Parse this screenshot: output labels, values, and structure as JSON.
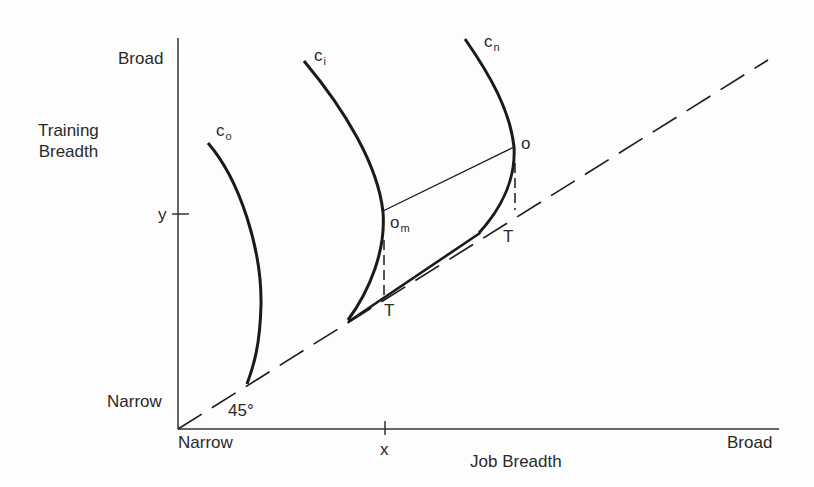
{
  "figure": {
    "y_axis": {
      "title_line1": "Training",
      "title_line2": "Breadth",
      "top_label": "Broad",
      "bottom_label": "Narrow",
      "tick_label": "y"
    },
    "x_axis": {
      "title": "Job Breadth",
      "left_label": "Narrow",
      "right_label": "Broad",
      "tick_label": "x"
    },
    "diagonal": {
      "angle_label": "45°",
      "style": "dashed"
    },
    "curves": [
      {
        "id": "c_o",
        "base": "c",
        "subscript": "o"
      },
      {
        "id": "c_i",
        "base": "c",
        "subscript": "i"
      },
      {
        "id": "c_n",
        "base": "c",
        "subscript": "n"
      }
    ],
    "points": {
      "o_m": {
        "base": "o",
        "subscript": "m"
      },
      "o": {
        "base": "o"
      },
      "T_left": {
        "label": "T"
      },
      "T_right": {
        "label": "T"
      }
    },
    "colors": {
      "line": "#1a1a1a",
      "axis": "#333333",
      "background": "#fdfdfd"
    }
  }
}
